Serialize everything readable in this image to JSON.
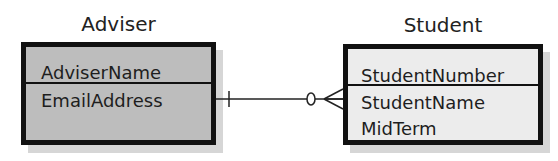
{
  "entities": [
    {
      "name": "Adviser",
      "fill": "#bdbdbd",
      "key_attributes": [
        "AdviserName"
      ],
      "attributes": [
        "EmailAddress"
      ]
    },
    {
      "name": "Student",
      "fill": "#ececec",
      "key_attributes": [
        "StudentNumber"
      ],
      "attributes": [
        "StudentName",
        "MidTerm"
      ]
    }
  ],
  "relationship": {
    "from": "Adviser",
    "to": "Student",
    "from_cardinality": "exactly-one (mandatory)",
    "to_cardinality": "zero-or-many (optional)"
  }
}
